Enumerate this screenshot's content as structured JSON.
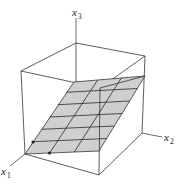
{
  "figure": {
    "axes": {
      "x1": {
        "base": "x",
        "sub": "1"
      },
      "x2": {
        "base": "x",
        "sub": "2"
      },
      "x3": {
        "base": "x",
        "sub": "3"
      }
    },
    "colors": {
      "plane_fill": "#cfcfcf",
      "lines": "#333333",
      "background": "#ffffff"
    },
    "plane": {
      "rows": 6,
      "columns": 3,
      "marked_points": 2
    }
  }
}
